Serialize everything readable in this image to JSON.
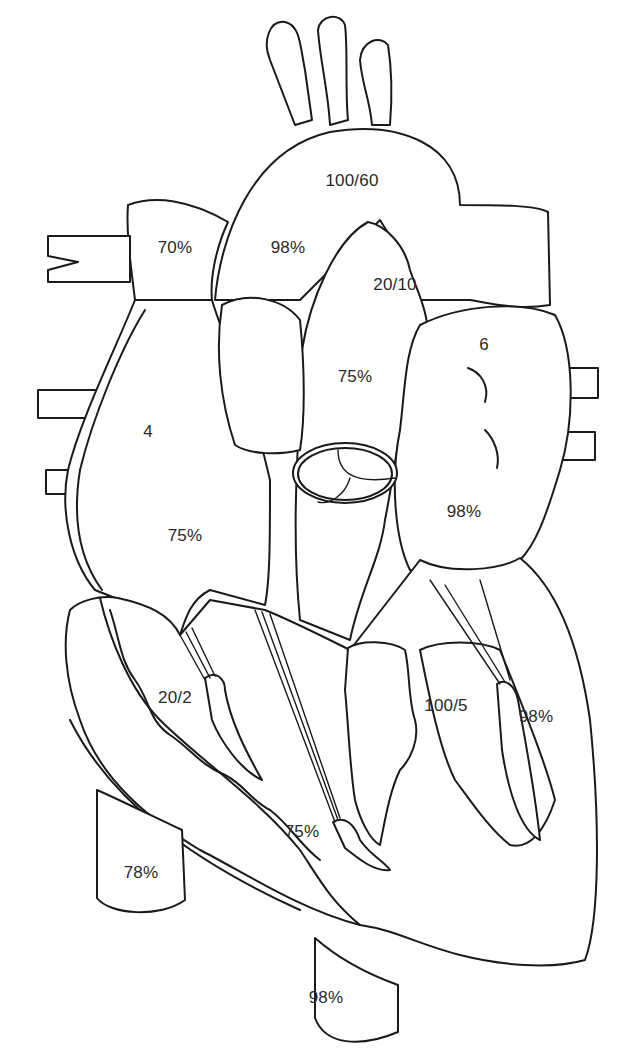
{
  "diagram": {
    "colors": {
      "stroke": "#1a1a1a",
      "background": "#ffffff",
      "text": "#2a2a2a"
    },
    "labels": [
      {
        "id": "aorta-pressure",
        "text": "100/60",
        "x": 352,
        "y": 181
      },
      {
        "id": "svc-saturation",
        "text": "70%",
        "x": 175,
        "y": 248
      },
      {
        "id": "aorta-saturation",
        "text": "98%",
        "x": 288,
        "y": 248
      },
      {
        "id": "pulmonary-artery-pressure",
        "text": "20/10",
        "x": 395,
        "y": 285
      },
      {
        "id": "left-atrium-pressure",
        "text": "6",
        "x": 484,
        "y": 345
      },
      {
        "id": "pulmonary-artery-saturation",
        "text": "75%",
        "x": 355,
        "y": 377
      },
      {
        "id": "right-atrium-pressure",
        "text": "4",
        "x": 148,
        "y": 432
      },
      {
        "id": "left-atrium-saturation",
        "text": "98%",
        "x": 464,
        "y": 512
      },
      {
        "id": "right-atrium-saturation",
        "text": "75%",
        "x": 185,
        "y": 536
      },
      {
        "id": "right-ventricle-pressure",
        "text": "20/2",
        "x": 175,
        "y": 698
      },
      {
        "id": "left-ventricle-pressure",
        "text": "100/5",
        "x": 446,
        "y": 706
      },
      {
        "id": "left-ventricle-saturation",
        "text": "98%",
        "x": 536,
        "y": 717
      },
      {
        "id": "right-ventricle-saturation",
        "text": "75%",
        "x": 302,
        "y": 832
      },
      {
        "id": "ivc-saturation",
        "text": "78%",
        "x": 141,
        "y": 873
      },
      {
        "id": "descending-aorta-saturation",
        "text": "98%",
        "x": 326,
        "y": 998
      }
    ]
  }
}
